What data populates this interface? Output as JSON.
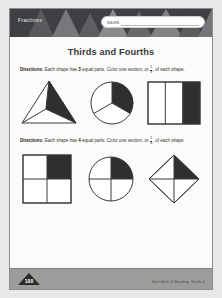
{
  "header": {
    "subject_label": "Fractions",
    "name_label": "NAME",
    "name_value": ""
  },
  "worksheet": {
    "title": "Thirds and Fourths",
    "sections": [
      {
        "directions_lead": "Directions:",
        "directions_text_1": "Each shape has",
        "parts_count": "3",
        "directions_text_2": "equal parts. Color one section, or",
        "fraction_numerator": "1",
        "fraction_denominator": "3",
        "directions_text_3": ", of each shape.",
        "shapes": [
          {
            "name": "triangle-thirds",
            "shaded_parts": 1,
            "total_parts": 3
          },
          {
            "name": "circle-thirds",
            "shaded_parts": 1,
            "total_parts": 3
          },
          {
            "name": "rectangle-thirds",
            "shaded_parts": 1,
            "total_parts": 3
          }
        ]
      },
      {
        "directions_lead": "Directions:",
        "directions_text_1": "Each shape has",
        "parts_count": "4",
        "directions_text_2": "equal parts. Color one section, or",
        "fraction_numerator": "1",
        "fraction_denominator": "4",
        "directions_text_3": ", of each shape.",
        "shapes": [
          {
            "name": "square-fourths",
            "shaded_parts": 1,
            "total_parts": 4
          },
          {
            "name": "circle-fourths",
            "shaded_parts": 1,
            "total_parts": 4
          },
          {
            "name": "diamond-fourths",
            "shaded_parts": 1,
            "total_parts": 4
          }
        ]
      }
    ]
  },
  "footer": {
    "credit": "Total Math & Reading, Grade 2",
    "logo_text": "100"
  },
  "colors": {
    "header_bg": "#3f4043",
    "shade_fill": "#2f2f31",
    "paper": "#fbfbfa",
    "footer_bg": "#9c9c9a"
  }
}
